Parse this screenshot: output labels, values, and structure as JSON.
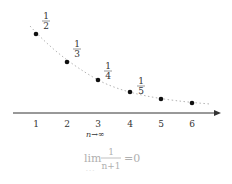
{
  "figure": {
    "sequence_term": "1/(n+1)",
    "points": [
      {
        "n": "1",
        "num": "1",
        "den": "2",
        "x": 36,
        "y": 34,
        "label_x": 46,
        "label_y": 12
      },
      {
        "n": "2",
        "num": "1",
        "den": "3",
        "x": 67,
        "y": 62,
        "label_x": 77,
        "label_y": 40
      },
      {
        "n": "3",
        "num": "1",
        "den": "4",
        "x": 98,
        "y": 80,
        "label_x": 108,
        "label_y": 62
      },
      {
        "n": "4",
        "num": "1",
        "den": "5",
        "x": 130,
        "y": 92,
        "label_x": 141,
        "label_y": 77
      },
      {
        "n": "5",
        "num": "",
        "den": "",
        "x": 161,
        "y": 99
      },
      {
        "n": "6",
        "num": "",
        "den": "",
        "x": 192,
        "y": 103
      }
    ],
    "axis": {
      "ticks": [
        "1",
        "2",
        "3",
        "4",
        "5",
        "6"
      ],
      "arrow": "right"
    },
    "limit_subscript": "n→∞",
    "limit_expression": {
      "operator": "lim",
      "numerator": "1",
      "denominator": "n+1",
      "equals": "=0"
    },
    "colors": {
      "ink": "#222222",
      "curve": "#aaaaaa",
      "limit_text": "#b0b0b0"
    }
  }
}
